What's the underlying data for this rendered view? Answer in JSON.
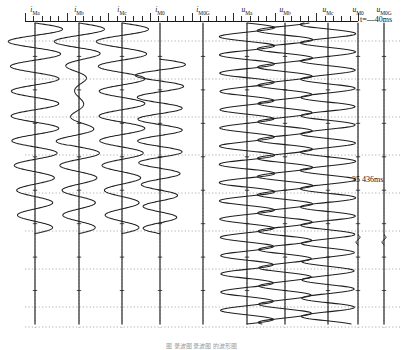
{
  "figure": {
    "caption": "图 录波图 录波图 的波形图",
    "background": "#ffffff",
    "trace_color": "#1f1f1f",
    "grid_color": "#8c8c8c",
    "axis_color": "#1a1a1a"
  },
  "time_annotations": {
    "start": {
      "symbol": "t",
      "equals": "=—",
      "value": "40ms",
      "text": "t=—40ms"
    },
    "middle": {
      "text": "35 436ms"
    }
  },
  "ruler": {
    "x_start": 25,
    "x_end": 358,
    "minor_tick_count": 40,
    "major_tick_count": 9
  },
  "channels": [
    {
      "name": "i_Ma",
      "base": "i",
      "sub": "Ma",
      "x": 35,
      "type": "current",
      "amplitude": 26,
      "cycles": 8.5,
      "ends_at": 0.7,
      "jitter": 0.1,
      "decay": 0.55
    },
    {
      "name": "i_Mb",
      "base": "i",
      "sub": "Mb",
      "x": 79,
      "type": "current",
      "amplitude": 24,
      "cycles": 8.5,
      "ends_at": 0.7,
      "jitter": 0.1,
      "decay": 0.55,
      "damped_window": [
        0.12,
        0.58
      ],
      "damped_amp": 4
    },
    {
      "name": "i_Mc",
      "base": "i",
      "sub": "Mc",
      "x": 122,
      "type": "current",
      "amplitude": 25,
      "cycles": 8.5,
      "ends_at": 0.7,
      "jitter": 0.1,
      "decay": 0.55
    },
    {
      "name": "i_M0",
      "base": "i",
      "sub": "M0",
      "x": 160,
      "type": "current",
      "amplitude": 24,
      "cycles": 8.0,
      "ends_at": 0.7,
      "starts_at": 0.12,
      "jitter": 0.1,
      "decay": 0.5
    },
    {
      "name": "i_M0G",
      "base": "i",
      "sub": "M0G",
      "x": 203,
      "type": "current",
      "amplitude": 0,
      "cycles": 0,
      "ends_at": 1.0,
      "flat": true
    },
    {
      "name": "u_Ma",
      "base": "u",
      "sub": "Ma",
      "x": 247,
      "type": "voltage",
      "amplitude": 27,
      "cycles": 16.5,
      "ends_at": 1.0,
      "jitter": 0.04
    },
    {
      "name": "u_Mb",
      "base": "u",
      "sub": "Mb",
      "x": 285,
      "type": "voltage",
      "amplitude": 27,
      "cycles": 16.5,
      "ends_at": 1.0,
      "jitter": 0.04,
      "phase": 2.094
    },
    {
      "name": "u_Mc",
      "base": "u",
      "sub": "Mc",
      "x": 328,
      "type": "voltage",
      "amplitude": 27,
      "cycles": 16.5,
      "ends_at": 1.0,
      "jitter": 0.04,
      "phase": 4.188
    },
    {
      "name": "u_M0",
      "base": "u",
      "sub": "M0",
      "x": 358,
      "type": "voltage",
      "amplitude": 0,
      "cycles": 0,
      "ends_at": 1.0,
      "flat": true,
      "blip_at": 0.72
    },
    {
      "name": "u_M0G",
      "base": "u",
      "sub": "M0G",
      "x": 384,
      "type": "voltage",
      "amplitude": 0,
      "cycles": 0,
      "ends_at": 1.0,
      "flat": true,
      "blip_at": 0.72
    }
  ],
  "gridlines": {
    "horizontal_dotted_y": [
      20,
      58,
      96,
      134,
      172,
      210,
      248,
      286,
      306
    ],
    "vertical_dotted_x": [
      35,
      79,
      122,
      160,
      203,
      247,
      285,
      328,
      358,
      384
    ]
  },
  "chart_data": {
    "type": "line",
    "orientation": "vertical-time-downward",
    "xlabel": "",
    "ylabel": "time (ms)",
    "legend_position": "top",
    "grid": true,
    "series": [
      {
        "name": "i_Ma",
        "label": "i_Ma",
        "kind": "current",
        "active": true,
        "note": "sinusoidal, terminates ~70% down"
      },
      {
        "name": "i_Mb",
        "label": "i_Mb",
        "kind": "current",
        "active": true,
        "note": "heavily damped mid-record"
      },
      {
        "name": "i_Mc",
        "label": "i_Mc",
        "kind": "current",
        "active": true,
        "note": "sinusoidal, terminates ~70% down"
      },
      {
        "name": "i_M0",
        "label": "i_M0",
        "kind": "current",
        "active": true,
        "note": "zero-sequence current, appears after fault"
      },
      {
        "name": "i_M0G",
        "label": "i_M0G",
        "kind": "current",
        "active": false,
        "note": "flat / zero"
      },
      {
        "name": "u_Ma",
        "label": "u_Ma",
        "kind": "voltage",
        "active": true,
        "note": "continuous sinusoid full record"
      },
      {
        "name": "u_Mb",
        "label": "u_Mb",
        "kind": "voltage",
        "active": true,
        "note": "continuous sinusoid full record"
      },
      {
        "name": "u_Mc",
        "label": "u_Mc",
        "kind": "voltage",
        "active": true,
        "note": "continuous sinusoid full record"
      },
      {
        "name": "u_M0",
        "label": "u_M0",
        "kind": "voltage",
        "active": false,
        "note": "flat with small transient blip"
      },
      {
        "name": "u_M0G",
        "label": "u_M0G",
        "kind": "voltage",
        "active": false,
        "note": "flat with small transient blip"
      }
    ],
    "time_markers": [
      {
        "label": "t=—40ms",
        "position": "top"
      },
      {
        "label": "35 436ms",
        "position": "middle"
      }
    ]
  }
}
